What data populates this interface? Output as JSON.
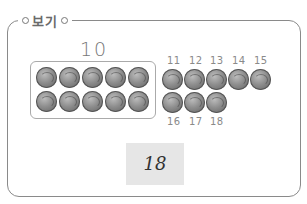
{
  "example": {
    "title": "보기",
    "ten_label": "10",
    "ten_box_count": 10,
    "extra_labels_top": [
      "11",
      "12",
      "13",
      "14",
      "15"
    ],
    "extra_labels_bottom": [
      "16",
      "17",
      "18"
    ],
    "answer": "18"
  }
}
